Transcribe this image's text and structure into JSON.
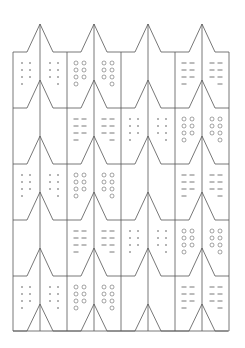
{
  "diagram": {
    "title": "",
    "type": "tessellation-pattern",
    "colors": {
      "line": "#555555",
      "background": "#ffffff"
    },
    "grid": {
      "left": 13,
      "right": 228,
      "unit_width": 54,
      "peak_offset": 27,
      "shoulder_half_width": 13,
      "peak_y": [
        24,
        80,
        136,
        192,
        248,
        304
      ],
      "shoulder_y": [
        52,
        108,
        164,
        220,
        276,
        331
      ],
      "columns": 4,
      "rows": 5
    },
    "rows": [
      {
        "cells": [
          "dots",
          "circles",
          "empty",
          "dashes"
        ]
      },
      {
        "cells": [
          "empty",
          "dashes",
          "dots",
          "circles"
        ]
      },
      {
        "cells": [
          "dots",
          "circles",
          "empty",
          "dashes"
        ]
      },
      {
        "cells": [
          "empty",
          "dashes",
          "dots",
          "circles"
        ]
      },
      {
        "cells": [
          "dots",
          "circles",
          "empty",
          "dashes"
        ]
      }
    ],
    "mark_layout": {
      "count_per_half": 7,
      "col_offsets_left": [
        9,
        17
      ],
      "col_offsets_right": [
        37,
        45
      ],
      "row_offsets": [
        11,
        18,
        25,
        32
      ]
    }
  }
}
